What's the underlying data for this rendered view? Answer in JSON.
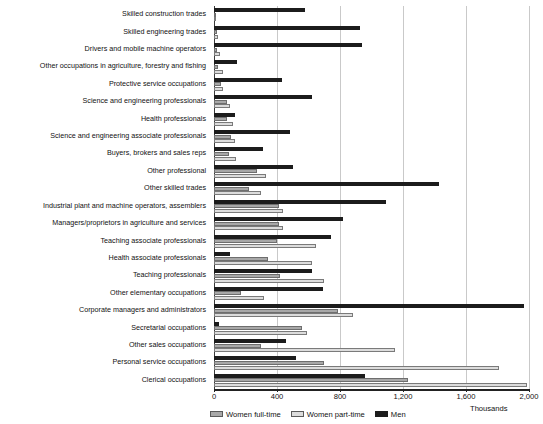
{
  "chart_data": {
    "type": "bar",
    "orientation": "horizontal",
    "title": "",
    "xlabel": "Thousands",
    "ylabel": "",
    "xlim": [
      0,
      2000
    ],
    "xticks": [
      0,
      400,
      800,
      1200,
      1600,
      2000
    ],
    "xtick_labels": [
      "0",
      "400",
      "800",
      "1,200",
      "1,600",
      "2,000"
    ],
    "grid": true,
    "legend_position": "bottom",
    "unit_label": "Thousands",
    "colors": {
      "women_full_time": "#a8a8a8",
      "women_part_time": "#dcdcdc",
      "men": "#1c1c1c"
    },
    "categories": [
      "Skilled construction trades",
      "Skilled engineering trades",
      "Drivers and mobile machine operators",
      "Other occupations in agriculture, forestry and fishing",
      "Protective service occupations",
      "Science and engineering professionals",
      "Health professionals",
      "Science and engineering associate professionals",
      "Buyers, brokers and sales reps",
      "Other professional",
      "Other skilled trades",
      "Industrial plant and machine operators, assemblers",
      "Managers/proprietors in agriculture and services",
      "Teaching associate professionals",
      "Health associate professionals",
      "Teaching professionals",
      "Other elementary occupations",
      "Corporate managers and administrators",
      "Secretarial occupations",
      "Other sales occupations",
      "Personal service occupations",
      "Clerical occupations"
    ],
    "series": [
      {
        "name": "Men",
        "key": "men",
        "color": "#1c1c1c",
        "values": [
          580,
          930,
          940,
          145,
          430,
          620,
          135,
          480,
          310,
          500,
          1430,
          1090,
          820,
          740,
          100,
          620,
          690,
          1970,
          30,
          460,
          520,
          960
        ]
      },
      {
        "name": "Women full-time",
        "key": "women_full_time",
        "color": "#a8a8a8",
        "values": [
          5,
          18,
          22,
          28,
          45,
          85,
          85,
          110,
          95,
          275,
          225,
          415,
          410,
          400,
          345,
          420,
          170,
          790,
          560,
          300,
          700,
          1230
        ]
      },
      {
        "name": "Women part-time",
        "key": "women_part_time",
        "color": "#dcdcdc",
        "values": [
          8,
          25,
          40,
          55,
          60,
          100,
          120,
          135,
          140,
          330,
          300,
          440,
          440,
          650,
          620,
          700,
          320,
          880,
          590,
          1150,
          1810,
          1990
        ]
      }
    ]
  },
  "legend": {
    "items": [
      {
        "label": "Women full-time",
        "key": "wft"
      },
      {
        "label": "Women part-time",
        "key": "wpt"
      },
      {
        "label": "Men",
        "key": "men"
      }
    ]
  }
}
